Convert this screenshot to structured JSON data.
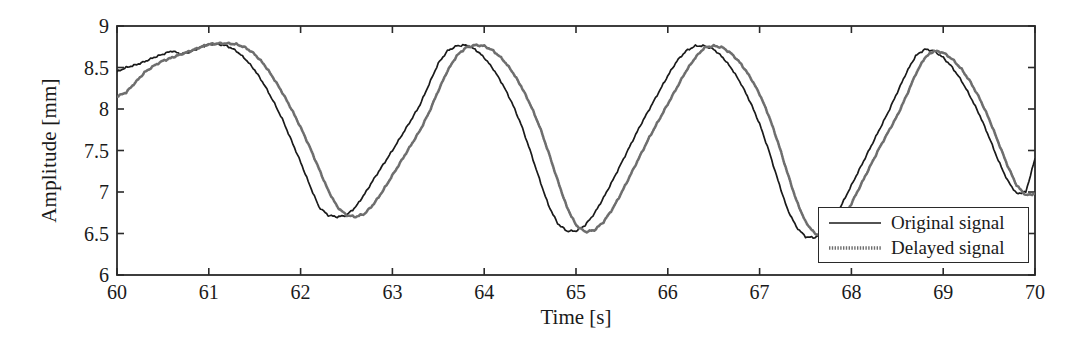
{
  "chart_data": {
    "type": "line",
    "title": "",
    "xlabel": "Time [s]",
    "ylabel": "Amplitude [mm]",
    "xlim": [
      60,
      70
    ],
    "ylim": [
      6,
      9
    ],
    "xticks": [
      60,
      61,
      62,
      63,
      64,
      65,
      66,
      67,
      68,
      69,
      70
    ],
    "yticks": [
      6,
      6.5,
      7,
      7.5,
      8,
      8.5,
      9
    ],
    "xtick_labels": [
      "60",
      "61",
      "62",
      "63",
      "64",
      "65",
      "66",
      "67",
      "68",
      "69",
      "70"
    ],
    "ytick_labels": [
      "6",
      "6.5",
      "7",
      "7.5",
      "8",
      "8.5",
      "9"
    ],
    "grid": false,
    "legend_position": "lower-right",
    "legend_entries": [
      "Original signal",
      "Delayed signal"
    ],
    "colors": {
      "original": "#1a1a1a",
      "delayed": "#6e6e6e",
      "axis": "#2a2a2a",
      "background": "#ffffff"
    },
    "series": [
      {
        "name": "Original signal",
        "style": "solid",
        "color": "#1a1a1a",
        "x": [
          60.0,
          60.1,
          60.2,
          60.3,
          60.4,
          60.5,
          60.6,
          60.7,
          60.8,
          60.9,
          61.0,
          61.1,
          61.2,
          61.3,
          61.4,
          61.5,
          61.6,
          61.7,
          61.8,
          61.9,
          62.0,
          62.1,
          62.2,
          62.3,
          62.4,
          62.5,
          62.6,
          62.7,
          62.8,
          62.9,
          63.0,
          63.1,
          63.2,
          63.3,
          63.4,
          63.5,
          63.6,
          63.7,
          63.8,
          63.9,
          64.0,
          64.1,
          64.2,
          64.3,
          64.4,
          64.5,
          64.6,
          64.7,
          64.8,
          64.9,
          65.0,
          65.1,
          65.2,
          65.3,
          65.4,
          65.5,
          65.6,
          65.7,
          65.8,
          65.9,
          66.0,
          66.1,
          66.2,
          66.3,
          66.4,
          66.5,
          66.6,
          66.7,
          66.8,
          66.9,
          67.0,
          67.1,
          67.2,
          67.3,
          67.4,
          67.5,
          67.6,
          67.7,
          67.8,
          67.9,
          68.0,
          68.1,
          68.2,
          68.3,
          68.4,
          68.5,
          68.6,
          68.7,
          68.8,
          68.9,
          69.0,
          69.1,
          69.2,
          69.3,
          69.4,
          69.5,
          69.6,
          69.7,
          69.8,
          69.9,
          70.0
        ],
        "y": [
          8.45,
          8.5,
          8.53,
          8.57,
          8.62,
          8.66,
          8.7,
          8.66,
          8.69,
          8.74,
          8.78,
          8.78,
          8.76,
          8.7,
          8.6,
          8.47,
          8.3,
          8.1,
          7.88,
          7.62,
          7.36,
          7.08,
          6.82,
          6.72,
          6.7,
          6.72,
          6.82,
          6.98,
          7.16,
          7.33,
          7.5,
          7.68,
          7.86,
          8.05,
          8.3,
          8.55,
          8.7,
          8.76,
          8.77,
          8.72,
          8.62,
          8.48,
          8.3,
          8.08,
          7.82,
          7.5,
          7.16,
          6.84,
          6.62,
          6.53,
          6.53,
          6.6,
          6.74,
          6.93,
          7.14,
          7.36,
          7.58,
          7.8,
          8.0,
          8.2,
          8.4,
          8.58,
          8.7,
          8.76,
          8.76,
          8.72,
          8.62,
          8.48,
          8.3,
          8.08,
          7.82,
          7.5,
          7.14,
          6.8,
          6.58,
          6.46,
          6.45,
          6.52,
          6.66,
          6.86,
          7.08,
          7.3,
          7.52,
          7.74,
          7.96,
          8.2,
          8.44,
          8.64,
          8.72,
          8.7,
          8.62,
          8.5,
          8.34,
          8.14,
          7.92,
          7.66,
          7.38,
          7.14,
          6.98,
          7.0,
          7.4
        ]
      },
      {
        "name": "Delayed signal",
        "style": "dotted",
        "color": "#6e6e6e",
        "x": [
          60.0,
          60.1,
          60.2,
          60.3,
          60.4,
          60.5,
          60.6,
          60.7,
          60.8,
          60.9,
          61.0,
          61.1,
          61.2,
          61.3,
          61.4,
          61.5,
          61.6,
          61.7,
          61.8,
          61.9,
          62.0,
          62.1,
          62.2,
          62.3,
          62.4,
          62.5,
          62.6,
          62.7,
          62.8,
          62.9,
          63.0,
          63.1,
          63.2,
          63.3,
          63.4,
          63.5,
          63.6,
          63.7,
          63.8,
          63.9,
          64.0,
          64.1,
          64.2,
          64.3,
          64.4,
          64.5,
          64.6,
          64.7,
          64.8,
          64.9,
          65.0,
          65.1,
          65.2,
          65.3,
          65.4,
          65.5,
          65.6,
          65.7,
          65.8,
          65.9,
          66.0,
          66.1,
          66.2,
          66.3,
          66.4,
          66.5,
          66.6,
          66.7,
          66.8,
          66.9,
          67.0,
          67.1,
          67.2,
          67.3,
          67.4,
          67.5,
          67.6,
          67.7,
          67.8,
          67.9,
          68.0,
          68.1,
          68.2,
          68.3,
          68.4,
          68.5,
          68.6,
          68.7,
          68.8,
          68.9,
          69.0,
          69.1,
          69.2,
          69.3,
          69.4,
          69.5,
          69.6,
          69.7,
          69.8,
          69.9,
          70.0
        ],
        "y": [
          8.15,
          8.2,
          8.32,
          8.44,
          8.52,
          8.58,
          8.62,
          8.66,
          8.7,
          8.74,
          8.78,
          8.79,
          8.79,
          8.78,
          8.74,
          8.66,
          8.54,
          8.38,
          8.2,
          8.0,
          7.78,
          7.54,
          7.28,
          7.02,
          6.82,
          6.72,
          6.7,
          6.74,
          6.86,
          7.02,
          7.2,
          7.38,
          7.56,
          7.74,
          7.96,
          8.22,
          8.46,
          8.64,
          8.74,
          8.77,
          8.76,
          8.7,
          8.6,
          8.46,
          8.28,
          8.06,
          7.8,
          7.48,
          7.14,
          6.82,
          6.6,
          6.52,
          6.54,
          6.64,
          6.8,
          7.0,
          7.22,
          7.44,
          7.66,
          7.86,
          8.06,
          8.26,
          8.46,
          8.62,
          8.74,
          8.76,
          8.74,
          8.66,
          8.54,
          8.38,
          8.18,
          7.92,
          7.6,
          7.24,
          6.9,
          6.64,
          6.5,
          6.46,
          6.52,
          6.66,
          6.86,
          7.08,
          7.3,
          7.52,
          7.72,
          7.92,
          8.16,
          8.42,
          8.62,
          8.7,
          8.68,
          8.6,
          8.48,
          8.32,
          8.12,
          7.88,
          7.6,
          7.32,
          7.08,
          6.96,
          6.98
        ]
      }
    ]
  },
  "axes": {
    "ylabel": "Amplitude [mm]",
    "xlabel": "Time [s]"
  },
  "legend": {
    "entries": [
      {
        "label": "Original signal"
      },
      {
        "label": "Delayed signal"
      }
    ]
  }
}
